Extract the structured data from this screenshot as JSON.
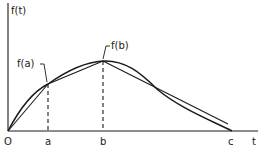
{
  "diagram": {
    "y_axis_label": "f(t)",
    "x_axis_label": "t",
    "origin_label": "O",
    "tick_labels": {
      "a": "a",
      "b": "b",
      "c": "c"
    },
    "point_labels": {
      "fa": "f(a)",
      "fb": "f(b)"
    }
  },
  "colors": {
    "ink": "#1a1a1a",
    "background": "#ffffff"
  }
}
